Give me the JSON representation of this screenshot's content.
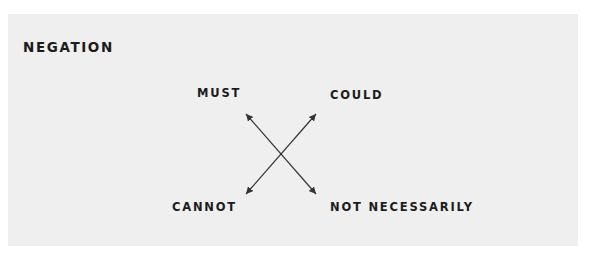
{
  "diagram": {
    "title": "NEGATION",
    "labels": {
      "top_left": "MUST",
      "top_right": "COULD",
      "bottom_left": "CANNOT",
      "bottom_right": "NOT NECESSARILY"
    },
    "arrows": [
      {
        "from": "MUST",
        "to": "NOT NECESSARILY",
        "type": "double-headed"
      },
      {
        "from": "COULD",
        "to": "CANNOT",
        "type": "double-headed"
      }
    ],
    "colors": {
      "panel": "#efefef",
      "text": "#1c1c1c",
      "arrow": "#333333"
    }
  }
}
